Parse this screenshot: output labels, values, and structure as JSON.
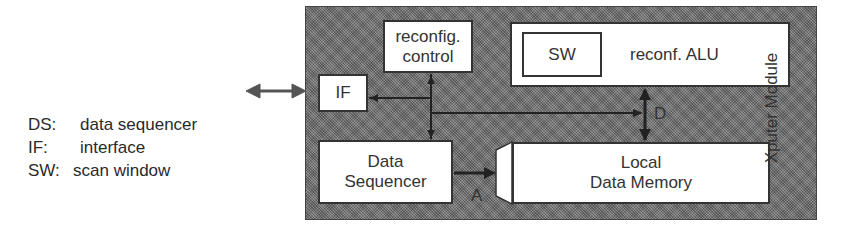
{
  "legend": [
    {
      "key": "DS:",
      "description": "data sequencer"
    },
    {
      "key": "IF:",
      "description": "interface"
    },
    {
      "key": "SW:",
      "description": "scan window"
    }
  ],
  "module": {
    "label": "Xputer Module",
    "blocks": {
      "reconfig_control": {
        "line1": "reconfig.",
        "line2": "control"
      },
      "interface": "IF",
      "alu": {
        "scan_window": "SW",
        "label": "reconf. ALU"
      },
      "data_sequencer": {
        "line1": "Data",
        "line2": "Sequencer"
      },
      "local_memory": {
        "line1": "Local",
        "line2": "Data Memory"
      }
    },
    "buses": {
      "data": "D",
      "address": "A"
    }
  }
}
